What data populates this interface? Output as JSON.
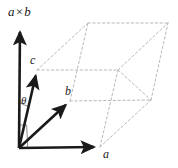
{
  "figure": {
    "background_color": "#ffffff",
    "width": 178,
    "height": 168,
    "labels": {
      "cross_axis": "a",
      "cross_operator": "×",
      "cross_axis_second": "b",
      "vector_c": "c",
      "vector_b": "b",
      "vector_a": "a",
      "angle_theta": "θ"
    },
    "colors": {
      "vector_stroke": "#1a1a1a",
      "dashed_stroke": "#b9b9b9",
      "angle_stroke": "#8c8c8c",
      "label_color": "#1a1a1a"
    }
  },
  "chart_data": {
    "type": "diagram",
    "subtype": "3d-vector-parallelepiped",
    "title": "",
    "xlabel": "",
    "ylabel": "",
    "grid": false,
    "legend": null,
    "points": {
      "origin": {
        "name": "O",
        "x": 19,
        "y": 148
      },
      "a_tip": {
        "name": "a",
        "x": 100,
        "y": 147
      },
      "b_tip": {
        "name": "b",
        "x": 70,
        "y": 101
      },
      "c_tip": {
        "name": "c",
        "x": 37,
        "y": 70
      },
      "cross_tip": {
        "name": "a×b",
        "x": 20,
        "y": 26
      },
      "a_plus_b": {
        "name": "a+b",
        "x": 151,
        "y": 100
      },
      "c_plus_a": {
        "name": "c+a",
        "x": 118,
        "y": 70
      },
      "c_plus_b": {
        "name": "c+b",
        "x": 88,
        "y": 23
      },
      "c_plus_a_plus_b": {
        "name": "c+a+b",
        "x": 168,
        "y": 23
      }
    },
    "solid_vectors": [
      {
        "name": "a×b-axis",
        "from": "origin",
        "to": "cross_tip",
        "arrow": true,
        "width": 2.6
      },
      {
        "name": "a-axis",
        "from": "origin",
        "to": "a_tip",
        "arrow": true,
        "width": 2.6
      },
      {
        "name": "b-vector",
        "from": "origin",
        "to": "b_tip",
        "arrow": true,
        "width": 2.6
      },
      {
        "name": "c-vector",
        "from": "origin",
        "to": "c_tip",
        "arrow": true,
        "width": 2.6
      }
    ],
    "dashed_edges": [
      {
        "from": "c_tip",
        "to": "c_plus_b"
      },
      {
        "from": "c_tip",
        "to": "c_plus_a"
      },
      {
        "from": "c_plus_b",
        "to": "c_plus_a_plus_b"
      },
      {
        "from": "c_plus_a",
        "to": "c_plus_a_plus_b"
      },
      {
        "from": "b_tip",
        "to": "c_plus_b"
      },
      {
        "from": "b_tip",
        "to": "a_plus_b"
      },
      {
        "from": "a_plus_b",
        "to": "c_plus_a_plus_b"
      },
      {
        "from": "a_tip",
        "to": "a_plus_b"
      },
      {
        "from": "a_tip",
        "to": "c_plus_a"
      },
      {
        "from": "c_plus_a",
        "to": "a_plus_b"
      }
    ],
    "annotations": [
      {
        "name": "theta-angle-arc",
        "text": "θ",
        "between": [
          "a×b-axis",
          "c-vector"
        ],
        "at": {
          "x": 25,
          "y": 103
        }
      },
      {
        "name": "right-angle-mark",
        "text": "",
        "at": {
          "x": 24,
          "y": 133
        }
      }
    ],
    "label_positions": {
      "cross_axis_label": {
        "x": 8,
        "y": 16
      },
      "c_label": {
        "x": 30,
        "y": 64
      },
      "b_label": {
        "x": 66,
        "y": 96
      },
      "a_label": {
        "x": 103,
        "y": 157
      },
      "theta_label": {
        "x": 22,
        "y": 106
      }
    }
  }
}
